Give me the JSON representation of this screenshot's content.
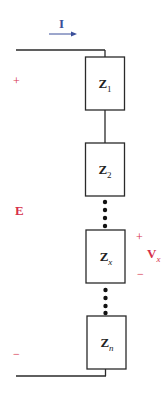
{
  "diagram": {
    "type": "series-circuit",
    "current": {
      "label": "I",
      "direction": "right",
      "color": "#3a4f9a"
    },
    "source": {
      "label": "E",
      "polarity_top": "+",
      "polarity_bottom": "−",
      "color": "#d6304a"
    },
    "impedances": [
      {
        "id": "z1",
        "label": "Z",
        "subscript": "1"
      },
      {
        "id": "z2",
        "label": "Z",
        "subscript": "2"
      },
      {
        "id": "zx",
        "label": "Z",
        "subscript": "x"
      },
      {
        "id": "zn",
        "label": "Z",
        "subscript": "n"
      }
    ],
    "ellipsis": [
      "•",
      "•",
      "•",
      "•"
    ],
    "voltage_drop": {
      "label": "V",
      "subscript": "x",
      "polarity_top": "+",
      "polarity_bottom": "−",
      "across": "zx",
      "color": "#d6304a"
    },
    "wire_color": "#2a2a2a"
  }
}
